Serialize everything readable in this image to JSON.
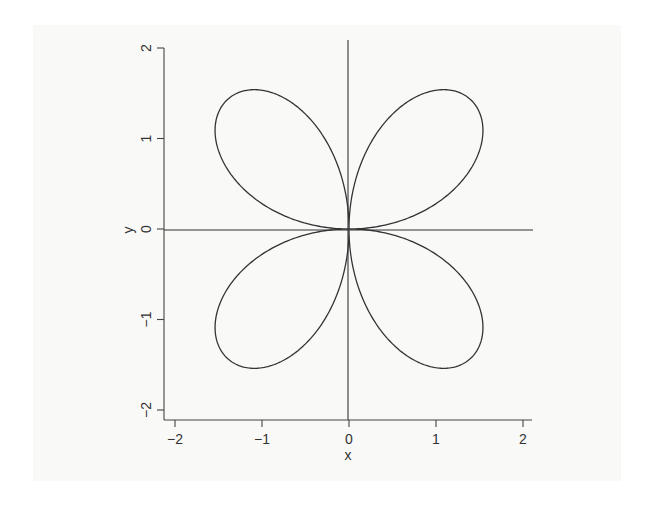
{
  "chart_data": {
    "type": "line",
    "title": "",
    "equation": "r = 2 sin(2θ)",
    "parameter_range": [
      0,
      6.283185
    ],
    "xlabel": "x",
    "ylabel": "y",
    "xlim": [
      -2,
      2
    ],
    "ylim": [
      -2,
      2
    ],
    "xticks": [
      -2,
      -1,
      0,
      1,
      2
    ],
    "yticks": [
      -2,
      -1,
      0,
      1,
      2
    ],
    "xtick_labels": [
      "−2",
      "−1",
      "0",
      "1",
      "2"
    ],
    "ytick_labels": [
      "−2",
      "−1",
      "0",
      "1",
      "2"
    ],
    "grid": false,
    "legend": null,
    "reference_lines": [
      {
        "orientation": "vertical",
        "x": 0
      },
      {
        "orientation": "horizontal",
        "y": 0
      }
    ],
    "series": [
      {
        "name": "rose curve",
        "color": "#333333",
        "petals": 4,
        "max_extent": 1.54,
        "sample_points": [
          {
            "theta_deg": 0,
            "x": 0.0,
            "y": 0.0
          },
          {
            "theta_deg": 22.5,
            "x": 1.31,
            "y": 0.54
          },
          {
            "theta_deg": 35.26,
            "x": 1.54,
            "y": 1.09
          },
          {
            "theta_deg": 45,
            "x": 1.41,
            "y": 1.41
          },
          {
            "theta_deg": 54.74,
            "x": 1.09,
            "y": 1.54
          },
          {
            "theta_deg": 67.5,
            "x": 0.54,
            "y": 1.31
          },
          {
            "theta_deg": 90,
            "x": 0.0,
            "y": 0.0
          },
          {
            "theta_deg": 135,
            "x": 1.41,
            "y": -1.41
          },
          {
            "theta_deg": 225,
            "x": -1.41,
            "y": -1.41
          },
          {
            "theta_deg": 315,
            "x": -1.41,
            "y": 1.41
          }
        ]
      }
    ]
  },
  "colors": {
    "curve": "#333333",
    "axis": "#444444",
    "background": "#ffffff"
  }
}
